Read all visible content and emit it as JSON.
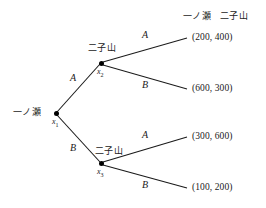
{
  "diagram": {
    "type": "extensive-form-game-tree",
    "column_headers": [
      {
        "id": "header-player-1",
        "label": "一ノ瀬"
      },
      {
        "id": "header-player-2",
        "label": "二子山"
      }
    ],
    "nodes": [
      {
        "id": "x1",
        "id_label": "x",
        "id_sub": "1",
        "player": "一ノ瀬",
        "x": 56,
        "y": 113
      },
      {
        "id": "x2",
        "id_label": "x",
        "id_sub": "2",
        "player": "二子山",
        "x": 101,
        "y": 63
      },
      {
        "id": "x3",
        "id_label": "x",
        "id_sub": "3",
        "player": "二子山",
        "x": 101,
        "y": 163
      }
    ],
    "branches": [
      {
        "id": "b-x1-A",
        "from": "x1",
        "to": "x2",
        "label": "A"
      },
      {
        "id": "b-x1-B",
        "from": "x1",
        "to": "x3",
        "label": "B"
      },
      {
        "id": "b-x2-A",
        "from": "x2",
        "to": "t1",
        "label": "A"
      },
      {
        "id": "b-x2-B",
        "from": "x2",
        "to": "t2",
        "label": "B"
      },
      {
        "id": "b-x3-A",
        "from": "x3",
        "to": "t3",
        "label": "A"
      },
      {
        "id": "b-x3-B",
        "from": "x3",
        "to": "t4",
        "label": "B"
      }
    ],
    "terminals": [
      {
        "id": "t1",
        "payoff": "(200, 400)",
        "player1": 200,
        "player2": 400
      },
      {
        "id": "t2",
        "payoff": "(600, 300)",
        "player1": 600,
        "player2": 300
      },
      {
        "id": "t3",
        "payoff": "(300, 600)",
        "player1": 300,
        "player2": 600
      },
      {
        "id": "t4",
        "payoff": "(100, 200)",
        "player1": 100,
        "player2": 200
      }
    ],
    "colors": {
      "line": "#1a1a1a",
      "node": "#000000",
      "text": "#1a1a1a",
      "background": "#ffffff"
    }
  }
}
